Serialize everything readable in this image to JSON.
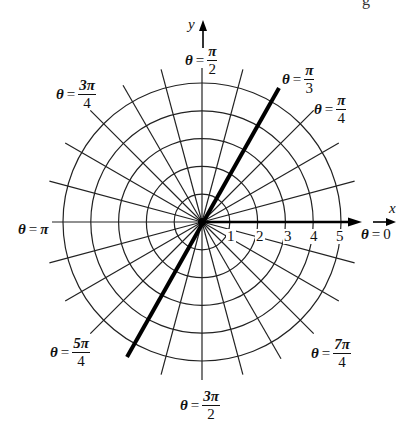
{
  "figure": {
    "type": "polar-coordinate-grid",
    "center": [
      202,
      222
    ],
    "ring_spacing_px": 27.8,
    "ring_labels": [
      "1",
      "2",
      "3",
      "4",
      "5"
    ],
    "ray_step_degrees": 15,
    "highlighted_ray": {
      "angle_label": "π/3",
      "description": "thick line through origin at θ = π/3 (extends to θ = 4π/3 direction)"
    },
    "axes": {
      "x_label": "x",
      "y_label": "y"
    },
    "colors": {
      "line": "#222222",
      "thick_line": "#000000",
      "background": "#ffffff"
    }
  },
  "labels": {
    "theta_0": {
      "prefix": "θ",
      "eq": "=",
      "value": "0"
    },
    "theta_pi": {
      "prefix": "θ",
      "eq": "=",
      "value": "π"
    },
    "theta_pi_2": {
      "prefix": "θ",
      "eq": "=",
      "num": "π",
      "den": "2"
    },
    "theta_pi_3": {
      "prefix": "θ",
      "eq": "=",
      "num": "π",
      "den": "3"
    },
    "theta_pi_4": {
      "prefix": "θ",
      "eq": "=",
      "num": "π",
      "den": "4"
    },
    "theta_3pi_4": {
      "prefix": "θ",
      "eq": "=",
      "num": "3π",
      "den": "4"
    },
    "theta_5pi_4": {
      "prefix": "θ",
      "eq": "=",
      "num": "5π",
      "den": "4"
    },
    "theta_3pi_2": {
      "prefix": "θ",
      "eq": "=",
      "num": "3π",
      "den": "2"
    },
    "theta_7pi_4": {
      "prefix": "θ",
      "eq": "=",
      "num": "7π",
      "den": "4"
    }
  },
  "corner_fragment": "g"
}
